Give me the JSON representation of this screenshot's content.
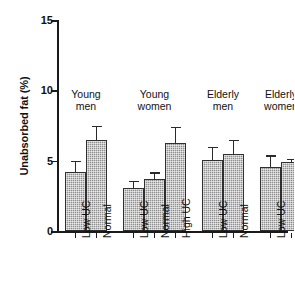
{
  "chart_data": {
    "type": "bar",
    "title": "",
    "xlabel": "",
    "ylabel": "Unabsorbed fat (%)",
    "ylim": [
      0,
      15
    ],
    "yticks": [
      0,
      5,
      10,
      15
    ],
    "ytick_labels": [
      "0",
      "5",
      "10",
      "15"
    ],
    "grid": false,
    "legend": "none",
    "error_bar_type": "standard error",
    "groups": [
      {
        "name": "Young men",
        "label_line1": "Young",
        "label_line2": "men",
        "bars": [
          {
            "label": "Low UC",
            "value": 4.2,
            "error": 0.8
          },
          {
            "label": "Normal",
            "value": 6.5,
            "error": 1.0
          }
        ]
      },
      {
        "name": "Young women",
        "label_line1": "Young",
        "label_line2": "women",
        "bars": [
          {
            "label": "Low UC",
            "value": 3.1,
            "error": 0.5
          },
          {
            "label": "Normal",
            "value": 3.7,
            "error": 0.5
          },
          {
            "label": "High UC",
            "value": 6.3,
            "error": 1.1
          }
        ]
      },
      {
        "name": "Elderly men",
        "label_line1": "Elderly",
        "label_line2": "men",
        "bars": [
          {
            "label": "Low UC",
            "value": 5.1,
            "error": 0.9
          },
          {
            "label": "Normal",
            "value": 5.5,
            "error": 1.0
          }
        ]
      },
      {
        "name": "Elderly women",
        "label_line1": "Elderly",
        "label_line2": "women",
        "bars": [
          {
            "label": "Low UC",
            "value": 4.6,
            "error": 0.8
          },
          {
            "label": "Normal",
            "value": 4.9,
            "error": 0.25
          }
        ]
      }
    ]
  },
  "axis": {
    "y_title": "Unabsorbed fat (%)",
    "tick_0": "0",
    "tick_5": "5",
    "tick_10": "10",
    "tick_15": "15"
  }
}
